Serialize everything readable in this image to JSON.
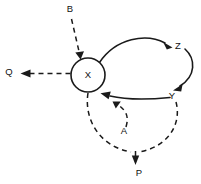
{
  "diagram": {
    "background_color": "#ffffff",
    "stroke_color": "#1a1a1a",
    "nodes": [
      {
        "id": "X",
        "label": "X",
        "shape": "circle",
        "x": 88,
        "y": 75,
        "r": 17
      },
      {
        "id": "B",
        "label": "B",
        "shape": "text",
        "x": 70,
        "y": 9
      },
      {
        "id": "Q",
        "label": "Q",
        "shape": "text",
        "x": 9,
        "y": 72
      },
      {
        "id": "Z",
        "label": "Z",
        "shape": "text",
        "x": 178,
        "y": 46
      },
      {
        "id": "Y",
        "label": "Y",
        "shape": "text",
        "x": 172,
        "y": 96
      },
      {
        "id": "A",
        "label": "A",
        "shape": "text",
        "x": 124,
        "y": 131
      },
      {
        "id": "P",
        "label": "P",
        "shape": "text",
        "x": 139,
        "y": 173
      }
    ],
    "edges": [
      {
        "id": "b-to-x",
        "from": "B",
        "to": "X",
        "style": "dashed",
        "arrow": true
      },
      {
        "id": "x-to-q",
        "from": "X",
        "to": "Q",
        "style": "dashed",
        "arrow": true
      },
      {
        "id": "x-to-z",
        "from": "X",
        "to": "Z",
        "style": "solid",
        "arrow": true
      },
      {
        "id": "z-to-y",
        "from": "Z",
        "to": "Y",
        "style": "solid",
        "arrow": true
      },
      {
        "id": "y-to-x",
        "from": "Y",
        "to": "X",
        "style": "solid",
        "arrow": true
      },
      {
        "id": "a-to-x",
        "from": "A",
        "to": "X",
        "style": "dashed",
        "arrow": true
      },
      {
        "id": "x-to-p",
        "from": "X",
        "to": "P",
        "style": "dashed",
        "arrow": true
      },
      {
        "id": "y-to-p",
        "from": "Y",
        "to": "P",
        "style": "dashed",
        "arrow": false
      }
    ]
  }
}
